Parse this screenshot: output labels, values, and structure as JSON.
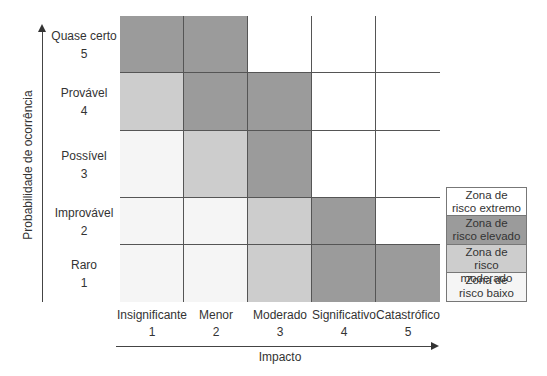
{
  "chart_data": {
    "type": "heatmap",
    "title": "",
    "xlabel": "Impacto",
    "ylabel": "Probabilidade de ocorrência",
    "x_categories": [
      {
        "label": "Insignificante",
        "value": "1"
      },
      {
        "label": "Menor",
        "value": "2"
      },
      {
        "label": "Moderado",
        "value": "3"
      },
      {
        "label": "Significativo",
        "value": "4"
      },
      {
        "label": "Catastrófico",
        "value": "5"
      }
    ],
    "y_categories_top_to_bottom": [
      {
        "label": "Quase certo",
        "value": "5"
      },
      {
        "label": "Provável",
        "value": "4"
      },
      {
        "label": "Possível",
        "value": "3"
      },
      {
        "label": "Improvável",
        "value": "2"
      },
      {
        "label": "Raro",
        "value": "1"
      }
    ],
    "matrix_top_to_bottom": [
      [
        "elevado",
        "elevado",
        "extremo",
        "extremo",
        "extremo"
      ],
      [
        "moderado",
        "elevado",
        "elevado",
        "extremo",
        "extremo"
      ],
      [
        "baixo",
        "moderado",
        "elevado",
        "extremo",
        "extremo"
      ],
      [
        "baixo",
        "baixo",
        "moderado",
        "elevado",
        "extremo"
      ],
      [
        "baixo",
        "baixo",
        "moderado",
        "elevado",
        "elevado"
      ]
    ],
    "legend": [
      {
        "key": "extremo",
        "line1": "Zona de",
        "line2": "risco extremo",
        "color": "#ffffff"
      },
      {
        "key": "elevado",
        "line1": "Zona de",
        "line2": "risco elevado",
        "color": "#9b9b9b"
      },
      {
        "key": "moderado",
        "line1": "Zona de",
        "line2": "risco moderado",
        "color": "#cdcdcd"
      },
      {
        "key": "baixo",
        "line1": "Zona de",
        "line2": "risco baixo",
        "color": "#f5f5f5"
      }
    ],
    "legend_position": "right"
  }
}
